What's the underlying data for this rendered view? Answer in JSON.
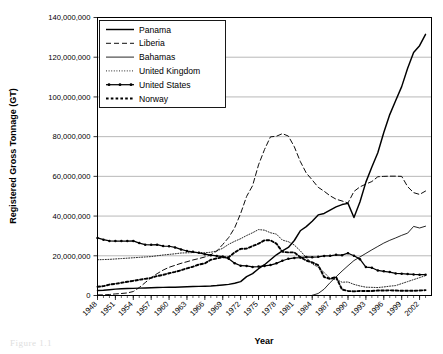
{
  "figure": {
    "caption_fragment": "Figure 1.1"
  },
  "chart_data": {
    "type": "line",
    "title": "",
    "xlabel": "Year",
    "ylabel": "Registered Gross Tonnage (GT)",
    "ylim": [
      0,
      140000000
    ],
    "xlim": [
      1948,
      2004
    ],
    "grid": "horizontal",
    "legend_position": "top-left",
    "ytick_labels": [
      "0",
      "20,000,000",
      "40,000,000",
      "60,000,000",
      "80,000,000",
      "100,000,000",
      "120,000,000",
      "140,000,000"
    ],
    "ytick_values": [
      0,
      20000000,
      40000000,
      60000000,
      80000000,
      100000000,
      120000000,
      140000000
    ],
    "xtick_labels": [
      "1948",
      "1951",
      "1954",
      "1957",
      "1960",
      "1963",
      "1966",
      "1969",
      "1972",
      "1975",
      "1978",
      "1981",
      "1984",
      "1987",
      "1990",
      "1993",
      "1996",
      "1999",
      "2002"
    ],
    "xtick_values": [
      1948,
      1951,
      1954,
      1957,
      1960,
      1963,
      1966,
      1969,
      1972,
      1975,
      1978,
      1981,
      1984,
      1987,
      1990,
      1993,
      1996,
      1999,
      2002
    ],
    "x": [
      1948,
      1949,
      1950,
      1951,
      1952,
      1953,
      1954,
      1955,
      1956,
      1957,
      1958,
      1959,
      1960,
      1961,
      1962,
      1963,
      1964,
      1965,
      1966,
      1967,
      1968,
      1969,
      1970,
      1971,
      1972,
      1973,
      1974,
      1975,
      1976,
      1977,
      1978,
      1979,
      1980,
      1981,
      1982,
      1983,
      1984,
      1985,
      1986,
      1987,
      1988,
      1989,
      1990,
      1991,
      1992,
      1993,
      1994,
      1995,
      1996,
      1997,
      1998,
      1999,
      2000,
      2001,
      2002,
      2003
    ],
    "series": [
      {
        "name": "Panama",
        "style": "solid",
        "marker": "none",
        "color": "#000000",
        "values": [
          2500000,
          2600000,
          2900000,
          3200000,
          3400000,
          3500000,
          3600000,
          3700000,
          3800000,
          3900000,
          4000000,
          4100000,
          4200000,
          4200000,
          4300000,
          4400000,
          4500000,
          4600000,
          4700000,
          4800000,
          5000000,
          5300000,
          5600000,
          6200000,
          7000000,
          9500000,
          11000000,
          13500000,
          15500000,
          18000000,
          20500000,
          22500000,
          24200000,
          27700000,
          32600000,
          34700000,
          37400000,
          40600000,
          41300000,
          43000000,
          44600000,
          45800000,
          46400000,
          39300000,
          47100000,
          57100000,
          64700000,
          71900000,
          82100000,
          91100000,
          98200000,
          105200000,
          114400000,
          122400000,
          125800000,
          131500000
        ]
      },
      {
        "name": "Liberia",
        "style": "dashed",
        "marker": "none",
        "color": "#000000",
        "values": [
          300000,
          300000,
          500000,
          800000,
          1000000,
          1300000,
          2000000,
          4000000,
          6500000,
          9000000,
          11000000,
          12800000,
          14200000,
          15200000,
          16200000,
          17000000,
          17900000,
          18600000,
          19400000,
          20500000,
          22400000,
          25700000,
          29200000,
          34100000,
          41300000,
          49900000,
          55300000,
          65800000,
          73500000,
          79900000,
          80200000,
          81500000,
          80300000,
          74900000,
          67500000,
          61700000,
          58200000,
          54500000,
          52500000,
          50200000,
          48500000,
          47600000,
          46600000,
          52400000,
          54700000,
          56100000,
          57400000,
          59800000,
          60000000,
          60100000,
          60100000,
          60000000,
          54800000,
          51800000,
          50900000,
          52600000
        ]
      },
      {
        "name": "Bahamas",
        "style": "solid-thin",
        "marker": "none",
        "color": "#000000",
        "values": [
          0,
          0,
          0,
          0,
          0,
          0,
          0,
          0,
          0,
          0,
          0,
          0,
          0,
          0,
          0,
          0,
          0,
          0,
          0,
          0,
          0,
          0,
          0,
          0,
          0,
          0,
          0,
          0,
          0,
          0,
          0,
          0,
          0,
          0,
          0,
          0,
          100000,
          1000000,
          3200000,
          6500000,
          9400000,
          12300000,
          15000000,
          17600000,
          19400000,
          21200000,
          23000000,
          24700000,
          26400000,
          27800000,
          29000000,
          30300000,
          31400000,
          34800000,
          34000000,
          34900000
        ]
      },
      {
        "name": "United Kingdom",
        "style": "dotted",
        "marker": "none",
        "color": "#000000",
        "values": [
          18000000,
          18100000,
          18200000,
          18400000,
          18600000,
          18800000,
          19000000,
          19200000,
          19400000,
          19600000,
          20000000,
          20400000,
          20700000,
          21000000,
          21400000,
          21500000,
          21600000,
          21700000,
          21500000,
          21800000,
          22400000,
          23800000,
          25800000,
          27300000,
          28600000,
          30200000,
          31600000,
          33200000,
          32900000,
          31600000,
          30900000,
          27900000,
          27100000,
          25400000,
          22500000,
          19100000,
          15900000,
          14300000,
          11600000,
          8500000,
          8100000,
          6700000,
          6800000,
          5600000,
          4800000,
          4200000,
          4100000,
          4000000,
          4300000,
          4700000,
          5000000,
          6000000,
          7000000,
          8000000,
          9000000,
          10000000
        ]
      },
      {
        "name": "United States",
        "style": "dash-dot",
        "marker": "dot",
        "color": "#000000",
        "values": [
          29000000,
          28100000,
          27500000,
          27400000,
          27400000,
          27400000,
          27500000,
          26400000,
          25600000,
          25500000,
          25600000,
          24900000,
          24800000,
          24200000,
          23200000,
          22400000,
          22000000,
          21500000,
          20800000,
          20300000,
          19900000,
          19600000,
          18500000,
          16300000,
          15000000,
          14900000,
          14400000,
          14600000,
          14900000,
          15300000,
          16200000,
          17500000,
          18500000,
          18900000,
          19100000,
          19400000,
          19300000,
          19500000,
          19900000,
          20000000,
          20500000,
          20300000,
          21300000,
          20000000,
          18300000,
          14300000,
          14000000,
          12600000,
          12200000,
          11800000,
          11100000,
          11000000,
          10800000,
          10600000,
          10500000,
          10500000
        ]
      },
      {
        "name": "Norway",
        "style": "dotted-heavy",
        "marker": "none",
        "color": "#000000",
        "values": [
          4400000,
          4700000,
          5500000,
          5900000,
          6400000,
          6900000,
          7400000,
          7900000,
          8400000,
          8900000,
          9800000,
          10400000,
          11200000,
          11900000,
          12700000,
          13700000,
          14500000,
          15600000,
          16200000,
          18000000,
          18700000,
          19300000,
          19300000,
          21700000,
          23500000,
          23600000,
          24900000,
          26100000,
          27800000,
          27800000,
          26100000,
          22000000,
          21700000,
          21700000,
          19300000,
          17600000,
          16700000,
          15300000,
          9300000,
          8400000,
          9300000,
          3000000,
          2300000,
          2100000,
          2300000,
          2300000,
          2300000,
          2500000,
          2500000,
          2600000,
          2500000,
          2400000,
          2400000,
          2400000,
          2500000,
          2700000
        ]
      }
    ]
  },
  "legend": {
    "items": [
      {
        "label": "Panama"
      },
      {
        "label": "Liberia"
      },
      {
        "label": "Bahamas"
      },
      {
        "label": "United Kingdom"
      },
      {
        "label": "United States"
      },
      {
        "label": "Norway"
      }
    ]
  }
}
